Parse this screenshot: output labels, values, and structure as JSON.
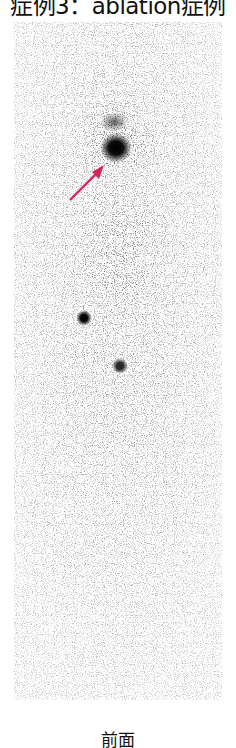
{
  "figure": {
    "title": "症例3：ablation症例",
    "caption": "前面",
    "image": {
      "kind": "whole-body scintigraphy, anterior view",
      "hot_spots": [
        {
          "label": "primary uptake (neck)",
          "x": 116,
          "y": 148,
          "r": 12
        },
        {
          "label": "secondary uptake",
          "x": 84,
          "y": 318,
          "r": 6
        },
        {
          "label": "secondary uptake",
          "x": 120,
          "y": 366,
          "r": 6
        }
      ],
      "arrow": {
        "color": "#d0285a",
        "from": [
          70,
          200
        ],
        "to": [
          104,
          166
        ]
      }
    }
  }
}
